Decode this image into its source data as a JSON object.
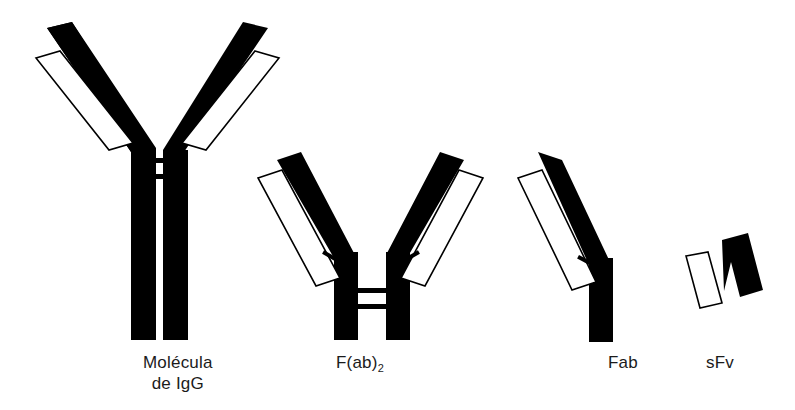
{
  "figure": {
    "background_color": "#ffffff",
    "ink_color": "#000000",
    "width": 795,
    "height": 410,
    "caption_language": "es"
  },
  "structures": [
    {
      "id": "igg",
      "label_line1": "Molécula",
      "label_line2": "de IgG",
      "label_left": 143,
      "label_top": 352,
      "parts": {
        "heavy_chains": 2,
        "light_chains": 2,
        "interchain_disulfides": 2,
        "has_fc_region": true
      }
    },
    {
      "id": "f-ab-2",
      "label_main": "F(ab)",
      "label_subscript": "2",
      "label_left": 336,
      "label_top": 352,
      "parts": {
        "heavy_chains": 2,
        "light_chains": 2,
        "interchain_disulfides": 2,
        "has_fc_region": false
      }
    },
    {
      "id": "fab",
      "label_main": "Fab",
      "label_left": 608,
      "label_top": 352,
      "parts": {
        "heavy_chains": 1,
        "light_chains": 1,
        "interchain_disulfides": 1,
        "has_fc_region": false
      }
    },
    {
      "id": "sfv",
      "label_main": "sFv",
      "label_left": 706,
      "label_top": 352,
      "parts": {
        "heavy_chains": 1,
        "light_chains": 1,
        "interchain_disulfides": 0,
        "has_fc_region": false
      }
    }
  ]
}
